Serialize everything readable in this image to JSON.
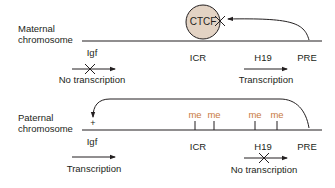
{
  "diagram": {
    "colors": {
      "line": "#231f20",
      "methyl": "#c8793e",
      "ctcf_fill": "#e3d3c4"
    },
    "maternal": {
      "label_line1": "Maternal",
      "label_line2": "chromosome",
      "protein": "CTCF",
      "loci": {
        "igf": "Igf",
        "icr": "ICR",
        "h19": "H19",
        "pre": "PRE"
      },
      "igf_status": "No transcription",
      "h19_status": "Transcription"
    },
    "paternal": {
      "label_line1": "Paternal",
      "label_line2": "chromosome",
      "enhancer_mark": "+",
      "methyl_marks": [
        "me",
        "me",
        "me",
        "me"
      ],
      "loci": {
        "igf": "Igf",
        "icr": "ICR",
        "h19": "H19",
        "pre": "PRE"
      },
      "igf_status": "Transcription",
      "h19_status": "No transcription"
    }
  }
}
